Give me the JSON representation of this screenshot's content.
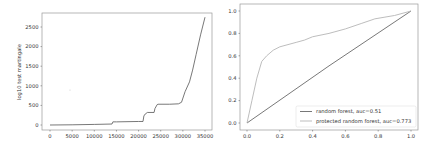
{
  "chart_data": [
    {
      "type": "line",
      "title": "",
      "xlabel": "",
      "ylabel": "log10 test martingale",
      "xlim": [
        -2000,
        37000
      ],
      "ylim": [
        -120,
        2850
      ],
      "xticks": [
        0,
        5000,
        10000,
        15000,
        20000,
        25000,
        30000,
        35000
      ],
      "xtick_labels": [
        "0",
        "5000",
        "10000",
        "15000",
        "20000",
        "25000",
        "30000",
        "35000"
      ],
      "yticks": [
        0,
        500,
        1000,
        1500,
        2000,
        2500
      ],
      "ytick_labels": [
        "0",
        "500",
        "1000",
        "1500",
        "2000",
        "2500"
      ],
      "grid": false,
      "series": [
        {
          "name": "log10 test martingale",
          "color": "#555555",
          "x": [
            0,
            5000,
            10000,
            14000,
            14200,
            15000,
            20000,
            21000,
            21200,
            21500,
            22000,
            23500,
            23700,
            24200,
            24400,
            27000,
            29000,
            29700,
            30500,
            31500,
            32200,
            33000,
            34000,
            35000
          ],
          "y": [
            0,
            5,
            15,
            25,
            80,
            80,
            90,
            90,
            230,
            280,
            320,
            320,
            420,
            520,
            530,
            530,
            540,
            580,
            850,
            1100,
            1400,
            1800,
            2300,
            2750
          ]
        }
      ]
    },
    {
      "type": "line",
      "title": "",
      "xlabel": "",
      "ylabel": "",
      "xlim": [
        -0.05,
        1.05
      ],
      "ylim": [
        -0.05,
        1.05
      ],
      "xticks": [
        0.0,
        0.2,
        0.4,
        0.6,
        0.8,
        1.0
      ],
      "xtick_labels": [
        "0.0",
        "0.2",
        "0.4",
        "0.6",
        "0.8",
        "1.0"
      ],
      "yticks": [
        0.0,
        0.2,
        0.4,
        0.6,
        0.8,
        1.0
      ],
      "ytick_labels": [
        "0.0",
        "0.2",
        "0.4",
        "0.6",
        "0.8",
        "1.0"
      ],
      "grid": false,
      "legend_position": "lower right",
      "series": [
        {
          "name": "random forest, auc=0.51",
          "color": "#555555",
          "x": [
            0.0,
            0.5,
            1.0
          ],
          "y": [
            0.0,
            0.51,
            1.0
          ]
        },
        {
          "name": "protected random forest, auc=0.773",
          "color": "#b5b5b5",
          "x": [
            0.0,
            0.03,
            0.06,
            0.09,
            0.12,
            0.16,
            0.2,
            0.3,
            0.35,
            0.4,
            0.5,
            0.6,
            0.7,
            0.78,
            0.9,
            1.0
          ],
          "y": [
            0.0,
            0.2,
            0.4,
            0.55,
            0.6,
            0.65,
            0.68,
            0.72,
            0.74,
            0.77,
            0.8,
            0.84,
            0.89,
            0.93,
            0.96,
            1.0
          ]
        }
      ]
    }
  ]
}
